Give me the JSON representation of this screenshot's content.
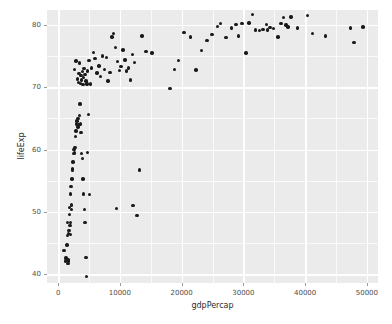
{
  "chart_data": {
    "type": "scatter",
    "title": "",
    "xlabel": "gdpPercap",
    "ylabel": "lifeExp",
    "xlim": [
      -1800,
      51800
    ],
    "ylim": [
      38.6,
      82.4
    ],
    "xticks": [
      0,
      10000,
      20000,
      30000,
      40000,
      50000
    ],
    "xtick_labels": [
      "0",
      "10000",
      "20000",
      "30000",
      "40000",
      "50000"
    ],
    "yticks": [
      40,
      50,
      60,
      70,
      80
    ],
    "ytick_labels": [
      "40",
      "50",
      "60",
      "70",
      "80"
    ],
    "x_minor_ticks": [
      5000,
      15000,
      25000,
      35000,
      45000
    ],
    "y_minor_ticks": [
      45,
      55,
      65,
      75
    ],
    "grid": true,
    "legend": "none",
    "panel_background": "#EBEBEB",
    "grid_color": "#FFFFFF",
    "point_color": "#1A1A1A",
    "points": [
      [
        974,
        43.8
      ],
      [
        1180,
        42.1
      ],
      [
        1250,
        42.6
      ],
      [
        1440,
        44.7
      ],
      [
        1520,
        46.2
      ],
      [
        1550,
        48.3
      ],
      [
        1600,
        41.7
      ],
      [
        1620,
        42.4
      ],
      [
        1680,
        42.1
      ],
      [
        1700,
        46.5
      ],
      [
        1750,
        47.0
      ],
      [
        1800,
        49.6
      ],
      [
        1840,
        50.7
      ],
      [
        1900,
        47.8
      ],
      [
        1960,
        46.4
      ],
      [
        2010,
        52.9
      ],
      [
        2030,
        48.3
      ],
      [
        2080,
        54.1
      ],
      [
        2140,
        51.1
      ],
      [
        2200,
        50.4
      ],
      [
        2250,
        55.3
      ],
      [
        2300,
        57.0
      ],
      [
        2360,
        56.7
      ],
      [
        2430,
        58.0
      ],
      [
        2550,
        59.4
      ],
      [
        2600,
        60.0
      ],
      [
        2700,
        59.5
      ],
      [
        2750,
        60.3
      ],
      [
        2850,
        62.1
      ],
      [
        2900,
        63.0
      ],
      [
        3000,
        64.1
      ],
      [
        3080,
        64.6
      ],
      [
        3200,
        65.0
      ],
      [
        3250,
        63.6
      ],
      [
        3350,
        64.0
      ],
      [
        3430,
        65.5
      ],
      [
        3550,
        67.3
      ],
      [
        3620,
        64.1
      ],
      [
        3700,
        62.7
      ],
      [
        3820,
        59.4
      ],
      [
        3900,
        58.6
      ],
      [
        4000,
        55.3
      ],
      [
        4100,
        52.9
      ],
      [
        4230,
        50.4
      ],
      [
        4350,
        48.3
      ],
      [
        4500,
        42.7
      ],
      [
        4620,
        39.6
      ],
      [
        4800,
        59.5
      ],
      [
        4950,
        65.6
      ],
      [
        5100,
        52.8
      ],
      [
        2700,
        72.9
      ],
      [
        2900,
        74.2
      ],
      [
        3100,
        71.3
      ],
      [
        3300,
        70.8
      ],
      [
        3400,
        72.2
      ],
      [
        3500,
        73.9
      ],
      [
        3600,
        70.6
      ],
      [
        3700,
        71.9
      ],
      [
        3800,
        71.2
      ],
      [
        3900,
        72.5
      ],
      [
        4000,
        70.4
      ],
      [
        4100,
        71.6
      ],
      [
        4200,
        73.0
      ],
      [
        4350,
        72.1
      ],
      [
        4500,
        71.0
      ],
      [
        4650,
        70.5
      ],
      [
        4800,
        72.6
      ],
      [
        5000,
        74.3
      ],
      [
        5200,
        70.5
      ],
      [
        5400,
        73.1
      ],
      [
        5700,
        75.6
      ],
      [
        6000,
        74.6
      ],
      [
        6300,
        72.3
      ],
      [
        6600,
        73.4
      ],
      [
        6900,
        71.7
      ],
      [
        7200,
        75.0
      ],
      [
        7500,
        72.9
      ],
      [
        7800,
        74.8
      ],
      [
        8100,
        71.0
      ],
      [
        8400,
        72.4
      ],
      [
        8700,
        78.1
      ],
      [
        9000,
        78.6
      ],
      [
        9300,
        76.4
      ],
      [
        9600,
        74.1
      ],
      [
        9900,
        72.7
      ],
      [
        10200,
        73.3
      ],
      [
        10500,
        76.0
      ],
      [
        10800,
        74.4
      ],
      [
        11100,
        72.6
      ],
      [
        11400,
        73.1
      ],
      [
        11700,
        71.2
      ],
      [
        12000,
        75.3
      ],
      [
        12400,
        74.0
      ],
      [
        12800,
        49.4
      ],
      [
        13200,
        56.7
      ],
      [
        9500,
        50.6
      ],
      [
        12100,
        51.0
      ],
      [
        13600,
        78.2
      ],
      [
        14200,
        75.7
      ],
      [
        15200,
        75.5
      ],
      [
        18100,
        69.8
      ],
      [
        18800,
        72.9
      ],
      [
        19500,
        74.3
      ],
      [
        20400,
        78.8
      ],
      [
        21400,
        78.1
      ],
      [
        22300,
        72.8
      ],
      [
        23200,
        75.9
      ],
      [
        24100,
        77.5
      ],
      [
        24900,
        78.5
      ],
      [
        25800,
        79.8
      ],
      [
        26300,
        80.2
      ],
      [
        27200,
        78.0
      ],
      [
        28100,
        79.5
      ],
      [
        28800,
        80.1
      ],
      [
        29200,
        78.2
      ],
      [
        29800,
        80.2
      ],
      [
        30400,
        75.5
      ],
      [
        30900,
        80.3
      ],
      [
        31500,
        81.7
      ],
      [
        32000,
        79.2
      ],
      [
        32600,
        79.1
      ],
      [
        33200,
        79.3
      ],
      [
        33700,
        80.1
      ],
      [
        33900,
        79.2
      ],
      [
        34300,
        79.6
      ],
      [
        34900,
        79.4
      ],
      [
        35600,
        78.1
      ],
      [
        36100,
        80.2
      ],
      [
        36500,
        81.2
      ],
      [
        36900,
        80.0
      ],
      [
        37200,
        79.7
      ],
      [
        37700,
        81.3
      ],
      [
        38800,
        79.5
      ],
      [
        40400,
        81.5
      ],
      [
        41200,
        78.6
      ],
      [
        43300,
        78.2
      ],
      [
        47300,
        79.5
      ],
      [
        47900,
        77.2
      ],
      [
        49400,
        79.7
      ]
    ]
  }
}
